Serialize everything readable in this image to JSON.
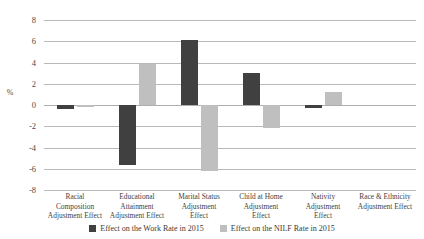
{
  "chart_data": {
    "type": "bar",
    "title": "",
    "subtitle": "",
    "xlabel": "",
    "ylabel": "%",
    "ylim": [
      -8,
      8
    ],
    "ytick_labels": [
      "8",
      "6",
      "4",
      "2",
      "0",
      "-2",
      "-4",
      "-6",
      "-8"
    ],
    "ytick_values": [
      8,
      6,
      4,
      2,
      0,
      -2,
      -4,
      -6,
      -8
    ],
    "grid": true,
    "legend_position": "bottom",
    "categories": [
      "Racial Composition Adjustment Effect",
      "Educational Attainment Adjustment Effect",
      "Marital Status Adjustment Effect",
      "Child at Home Adjustment Effect",
      "Nativity Adjustment Effect",
      "Race & Ethnicity Adjustment Effect"
    ],
    "category_label_lines": [
      [
        "Racial",
        "Composition",
        "Adjustment Effect"
      ],
      [
        "Educational",
        "Attainment",
        "Adjustment Effect"
      ],
      [
        "Marital Status",
        "Adjustment",
        "Effect"
      ],
      [
        "Child at Home",
        "Adjustment",
        "Effect"
      ],
      [
        "Nativity",
        "Adjustment",
        "Effect"
      ],
      [
        "Race & Ethnicity",
        "Adjustment Effect"
      ]
    ],
    "series": [
      {
        "name": "Effect on the Work Rate in 2015",
        "color": "#404040",
        "values": [
          -0.4,
          -5.6,
          6.1,
          3.0,
          -0.3,
          0.0
        ]
      },
      {
        "name": "Effect on the NILF Rate in 2015",
        "color": "#bfbfbf",
        "values": [
          -0.2,
          3.9,
          -6.2,
          -2.2,
          1.2,
          0.0
        ]
      }
    ]
  },
  "legend": {
    "entries": [
      {
        "label": "Effect on the Work Rate in 2015"
      },
      {
        "label": "Effect on the NILF Rate in 2015"
      }
    ]
  }
}
